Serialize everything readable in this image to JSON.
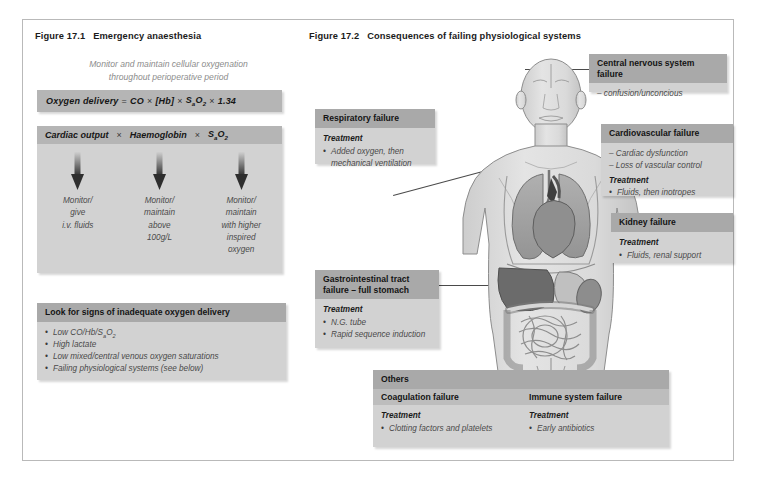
{
  "figures": {
    "left": {
      "caption_number": "Figure 17.1",
      "caption_title": "Emergency anaesthesia",
      "subtitle_line1": "Monitor and maintain cellular oxygenation",
      "subtitle_line2": "throughout perioperative period",
      "formula": {
        "label": "Oxygen delivery",
        "equals": "=",
        "term1": "CO",
        "op1": "×",
        "term2": "[Hb]",
        "op2": "×",
        "term3_main": "S",
        "term3_sub": "a",
        "term3_o": "O",
        "term3_o_sub": "2",
        "op3": "×",
        "term4": "1.34"
      },
      "triple": {
        "head_col1": "Cardiac output",
        "head_op1": "×",
        "head_col2": "Haemoglobin",
        "head_op2": "×",
        "head_col3_main": "S",
        "head_col3_sub": "a",
        "head_col3_o": "O",
        "head_col3_o_sub": "2",
        "col1_lines": [
          "Monitor/",
          "give",
          "i.v. fluids"
        ],
        "col2_lines": [
          "Monitor/",
          "maintain",
          "above",
          "100g/L"
        ],
        "col3_lines": [
          "Monitor/",
          "maintain",
          "with higher",
          "inspired",
          "oxygen"
        ]
      },
      "signs": {
        "header": "Look for signs of inadequate oxygen delivery",
        "items": [
          "Low CO/Hb/SaO2",
          "High lactate",
          "Low mixed/central venous oxygen saturations",
          "Failing physiological systems (see below)"
        ]
      }
    },
    "right": {
      "caption_number": "Figure 17.2",
      "caption_title": "Consequences of failing physiological systems",
      "boxes": {
        "cns": {
          "title": "Central nervous system failure",
          "lines": [
            "– confusion/unconcious"
          ]
        },
        "respiratory": {
          "title": "Respiratory failure",
          "treatment_label": "Treatment",
          "items": [
            "Added oxygen, then mechanical ventilation"
          ]
        },
        "cardiovascular": {
          "title": "Cardiovascular failure",
          "dashes": [
            "– Cardiac dysfunction",
            "– Loss of vascular control"
          ],
          "treatment_label": "Treatment",
          "items": [
            "Fluids, then inotropes"
          ]
        },
        "kidney": {
          "title": "Kidney failure",
          "treatment_label": "Treatment",
          "items": [
            "Fluids, renal support"
          ]
        },
        "gi": {
          "title_line1": "Gastrointestinal tract",
          "title_line2": "failure – full stomach",
          "treatment_label": "Treatment",
          "items": [
            "N.G. tube",
            "Rapid sequence induction"
          ]
        },
        "others": {
          "title": "Others",
          "col1_title": "Coagulation failure",
          "col1_treatment_label": "Treatment",
          "col1_items": [
            "Clotting factors and platelets"
          ],
          "col2_title": "Immune system failure",
          "col2_treatment_label": "Treatment",
          "col2_items": [
            "Early antibiotics"
          ]
        }
      }
    }
  },
  "colors": {
    "panel_header": "#a9a9a9",
    "panel_body": "#d2d2d2",
    "formula_bar": "#b5b5b5",
    "frame_border": "#b9b9b9",
    "text": "#1a1a1a",
    "muted_text": "#8c8c8c",
    "body_skin": "#dcdcdc",
    "organ_lung": "#a0a0a0",
    "organ_heart": "#8a8a8a",
    "organ_liver": "#6e6e6e",
    "connector": "#4a4a4a"
  },
  "body_figure": {
    "label": "anterior human torso with internal organs",
    "organs": [
      "brain",
      "lungs",
      "heart",
      "liver",
      "stomach",
      "kidney",
      "intestines"
    ]
  }
}
